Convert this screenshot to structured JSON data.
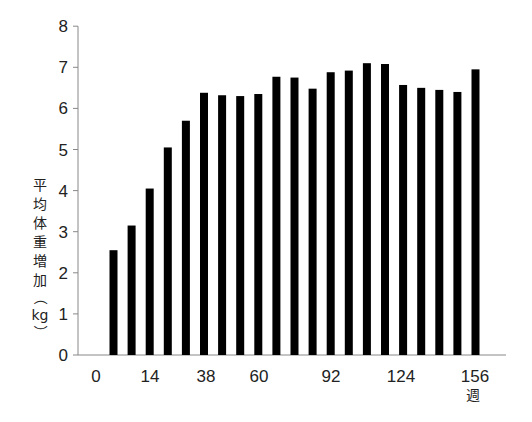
{
  "chart_data": {
    "type": "bar",
    "title": "",
    "xlabel": "週",
    "ylabel": "平均体重増加（kg）",
    "ylim": [
      0,
      8
    ],
    "y_ticks": [
      0,
      1,
      2,
      3,
      4,
      5,
      6,
      7,
      8
    ],
    "x_ticks": [
      {
        "label": "0",
        "px": 96
      },
      {
        "label": "14",
        "px": 150
      },
      {
        "label": "38",
        "px": 206
      },
      {
        "label": "60",
        "px": 259
      },
      {
        "label": "92",
        "px": 331
      },
      {
        "label": "124",
        "px": 401
      },
      {
        "label": "156",
        "px": 475
      }
    ],
    "grid": false,
    "legend": null,
    "bar_color": "#000000",
    "series": [
      {
        "name": "平均体重増加",
        "values": [
          2.55,
          3.15,
          4.05,
          5.05,
          5.7,
          6.38,
          6.32,
          6.3,
          6.35,
          6.77,
          6.75,
          6.48,
          6.88,
          6.92,
          7.1,
          7.08,
          6.57,
          6.5,
          6.45,
          6.4,
          6.95
        ]
      }
    ]
  },
  "labels": {
    "y_axis_chars": [
      "平",
      "均",
      "体",
      "重",
      "増",
      "加"
    ],
    "y_axis_open_paren": "（",
    "y_axis_unit": "kg",
    "y_axis_close_paren": "）",
    "x_axis_unit": "週"
  }
}
